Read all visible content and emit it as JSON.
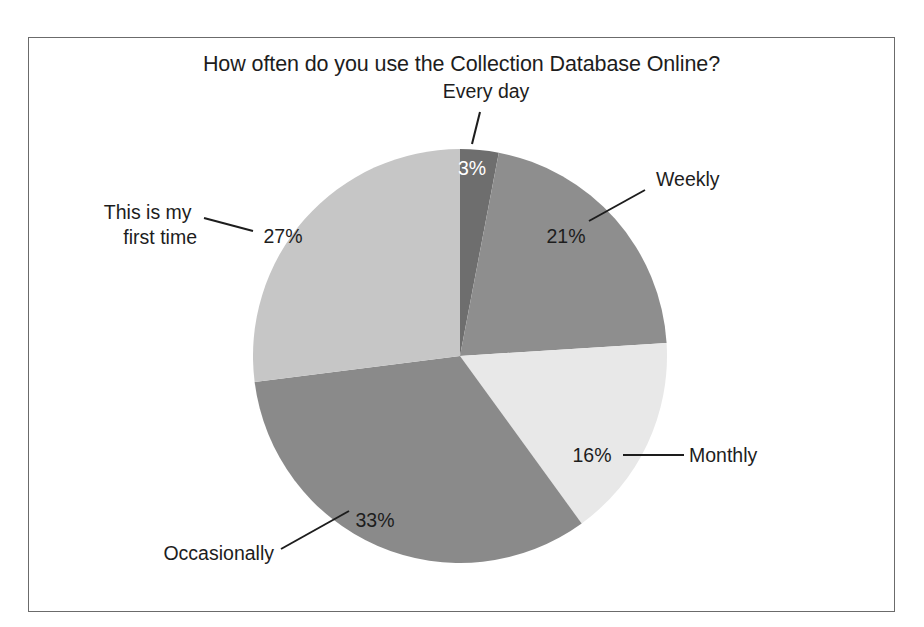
{
  "figure": {
    "title": "How often do you use the Collection Database Online?",
    "border_color": "#6b6b6b",
    "background": "#ffffff"
  },
  "chart_data": {
    "type": "pie",
    "title": "How often do you use the Collection Database Online?",
    "xlabel": "",
    "ylabel": "",
    "units": "percent",
    "start_angle_deg": 0,
    "direction": "clockwise",
    "legend": "none",
    "grid": false,
    "categories": [
      "Every day",
      "Weekly",
      "Monthly",
      "Occasionally",
      "This is my first time"
    ],
    "values": [
      3,
      21,
      16,
      33,
      27
    ],
    "value_labels": [
      "3%",
      "21%",
      "16%",
      "33%",
      "27%"
    ],
    "colors": [
      "#6e6e6e",
      "#8e8e8e",
      "#e8e8e8",
      "#8a8a8a",
      "#c6c6c6"
    ],
    "slices": [
      {
        "label": "Every day",
        "value": 3,
        "value_label": "3%",
        "color": "#6e6e6e",
        "label_text_color": "#ffffff",
        "label_position": "inside",
        "callout": "above-top"
      },
      {
        "label": "Weekly",
        "value": 21,
        "value_label": "21%",
        "color": "#8e8e8e",
        "label_text_color": "#1d1d1d",
        "label_position": "inside",
        "callout": "upper-right"
      },
      {
        "label": "Monthly",
        "value": 16,
        "value_label": "16%",
        "color": "#e8e8e8",
        "label_text_color": "#1d1d1d",
        "label_position": "inside",
        "callout": "right"
      },
      {
        "label": "Occasionally",
        "value": 33,
        "value_label": "33%",
        "color": "#8a8a8a",
        "label_text_color": "#1d1d1d",
        "label_position": "inside",
        "callout": "lower-left"
      },
      {
        "label": "This is my first time",
        "label_line_1": "This is my",
        "label_line_2": "first time",
        "value": 27,
        "value_label": "27%",
        "color": "#c6c6c6",
        "label_text_color": "#1d1d1d",
        "label_position": "inside",
        "callout": "left"
      }
    ]
  }
}
